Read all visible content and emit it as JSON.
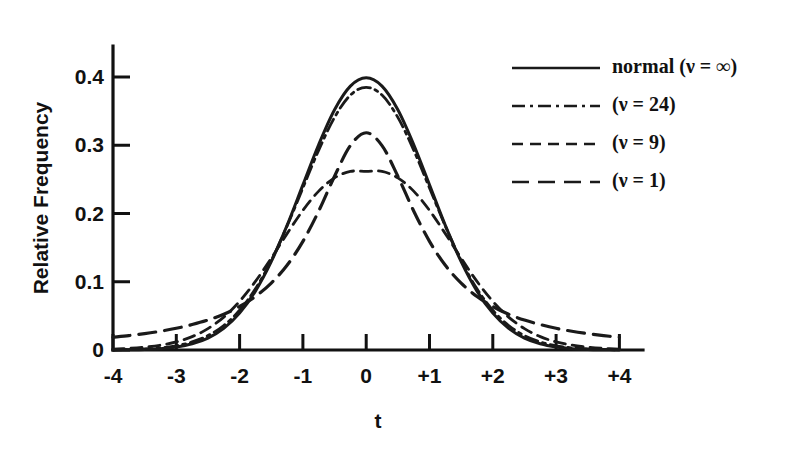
{
  "chart_data": {
    "type": "line",
    "title": "",
    "xlabel": "t",
    "ylabel": "Relative Frequency",
    "xlim": [
      -4,
      4
    ],
    "ylim": [
      0,
      0.45
    ],
    "grid": false,
    "legend_position": "top-right",
    "xticks": [
      -4,
      -3,
      -2,
      -1,
      0,
      1,
      2,
      3,
      4
    ],
    "xtick_labels": [
      "-4",
      "-3",
      "-2",
      "-1",
      "0",
      "+1",
      "+2",
      "+3",
      "+4"
    ],
    "yticks": [
      0,
      0.1,
      0.2,
      0.3,
      0.4
    ],
    "ytick_labels": [
      "0",
      "0.1",
      "0.2",
      "0.3",
      "0.4"
    ],
    "x": [
      -4,
      -3.75,
      -3.5,
      -3.25,
      -3,
      -2.75,
      -2.5,
      -2.25,
      -2,
      -1.75,
      -1.5,
      -1.25,
      -1,
      -0.75,
      -0.5,
      -0.25,
      0,
      0.25,
      0.5,
      0.75,
      1,
      1.25,
      1.5,
      1.75,
      2,
      2.25,
      2.5,
      2.75,
      3,
      3.25,
      3.5,
      3.75,
      4
    ],
    "series": [
      {
        "name": "normal (ν = ∞)",
        "dof": "∞",
        "style": "solid",
        "dasharray": "",
        "width": 3.0,
        "peak": 0.399,
        "values": [
          0.0001,
          0.0004,
          0.0009,
          0.002,
          0.0044,
          0.0091,
          0.0175,
          0.0317,
          0.054,
          0.0863,
          0.1295,
          0.1826,
          0.242,
          0.3011,
          0.3521,
          0.3867,
          0.3989,
          0.3867,
          0.3521,
          0.3011,
          0.242,
          0.1826,
          0.1295,
          0.0863,
          0.054,
          0.0317,
          0.0175,
          0.0091,
          0.0044,
          0.002,
          0.0009,
          0.0004,
          0.0001
        ]
      },
      {
        "name": "(ν = 24)",
        "dof": "24",
        "style": "dash-dot",
        "dasharray": "13,5,3,5",
        "width": 2.8,
        "peak": 0.3948,
        "values": [
          0.0003,
          0.0007,
          0.0015,
          0.0031,
          0.0062,
          0.0118,
          0.0211,
          0.0359,
          0.0582,
          0.0896,
          0.1311,
          0.1817,
          0.2375,
          0.2929,
          0.3409,
          0.3735,
          0.3849,
          0.3735,
          0.3409,
          0.2929,
          0.2375,
          0.1817,
          0.1311,
          0.0896,
          0.0582,
          0.0359,
          0.0211,
          0.0118,
          0.0062,
          0.0031,
          0.0015,
          0.0007,
          0.0003
        ]
      },
      {
        "name": "(ν = 9)",
        "dof": "9",
        "style": "dashed",
        "dasharray": "11,7",
        "width": 2.8,
        "peak": 0.3754,
        "values": [
          0.0014,
          0.0024,
          0.0042,
          0.0071,
          0.0119,
          0.0196,
          0.0313,
          0.0482,
          0.0713,
          0.1005,
          0.1345,
          0.1705,
          0.2046,
          0.2328,
          0.2522,
          0.2617,
          0.2616,
          0.2617,
          0.2522,
          0.2328,
          0.2046,
          0.1705,
          0.1345,
          0.1005,
          0.0713,
          0.0482,
          0.0313,
          0.0196,
          0.0119,
          0.0071,
          0.0042,
          0.0024,
          0.0014
        ]
      },
      {
        "name": "(ν = 1)",
        "dof": "1",
        "style": "long-dash",
        "dasharray": "17,9",
        "width": 3.2,
        "peak": 0.3183,
        "values": [
          0.0187,
          0.0211,
          0.024,
          0.0275,
          0.0318,
          0.0373,
          0.0439,
          0.0524,
          0.0637,
          0.0784,
          0.098,
          0.1241,
          0.1592,
          0.2037,
          0.2546,
          0.2995,
          0.3183,
          0.2995,
          0.2546,
          0.2037,
          0.1592,
          0.1241,
          0.098,
          0.0784,
          0.0637,
          0.0524,
          0.0439,
          0.0373,
          0.0318,
          0.0275,
          0.024,
          0.0211,
          0.0187
        ]
      }
    ],
    "legend_entries": [
      {
        "label": "normal (ν = ∞)",
        "style": "solid"
      },
      {
        "label": "(ν = 24)",
        "style": "dash-dot"
      },
      {
        "label": "(ν = 9)",
        "style": "dashed"
      },
      {
        "label": "(ν = 1)",
        "style": "long-dash"
      }
    ],
    "colors": {
      "ink": "#1a1a1a",
      "background": "#ffffff"
    }
  }
}
